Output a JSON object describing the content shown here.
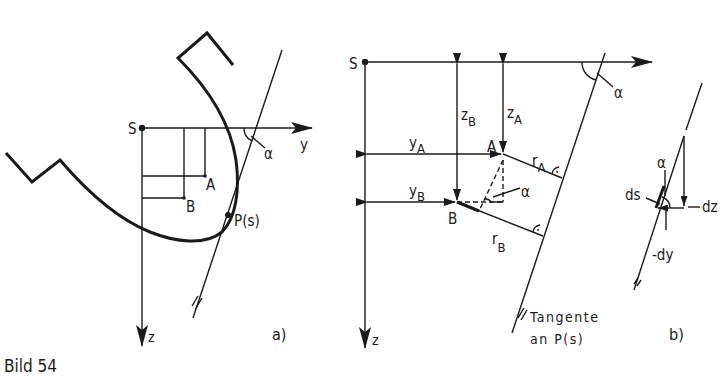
{
  "figure": {
    "caption": "Bild 54",
    "panel_a": {
      "label": "a)",
      "origin": "S",
      "axis_y": "y",
      "axis_z": "z",
      "points": [
        "A",
        "B"
      ],
      "curve_point": "P(s)",
      "angle": "α"
    },
    "panel_middle": {
      "origin": "S",
      "axis_y": "y",
      "axis_z": "z",
      "angle_top": "α",
      "angle_inner": "α",
      "point_a": "A",
      "point_b": "B",
      "dim_za": "z",
      "dim_za_sub": "A",
      "dim_zb": "z",
      "dim_zb_sub": "B",
      "dim_ya": "y",
      "dim_ya_sub": "A",
      "dim_yb": "y",
      "dim_yb_sub": "B",
      "dim_ra": "r",
      "dim_ra_sub": "A",
      "dim_rb": "r",
      "dim_rb_sub": "B",
      "tangent_line1": "Tangente",
      "tangent_line2": "an P(s)"
    },
    "panel_b": {
      "label": "b)",
      "angle": "α",
      "ds": "ds",
      "dz": "dz",
      "dy": "-dy"
    }
  },
  "colors": {
    "ink": "#1a1a1a",
    "paper": "#ffffff"
  }
}
